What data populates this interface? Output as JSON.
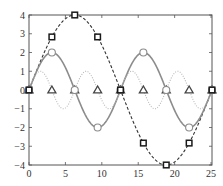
{
  "chart_data": {
    "type": "line",
    "title": "",
    "xlabel": "",
    "ylabel": "",
    "xlim": [
      0,
      25.1327
    ],
    "ylim": [
      -4,
      4
    ],
    "grid": false,
    "legend": null,
    "x_ticks": [
      0,
      5,
      10,
      15,
      20,
      25
    ],
    "y_ticks": [
      -4,
      -3,
      -2,
      -1,
      0,
      1,
      2,
      3,
      4
    ],
    "x_tick_labels": [
      "0",
      "5",
      "10",
      "15",
      "20",
      "25"
    ],
    "y_tick_labels": [
      "−4",
      "−3",
      "−2",
      "−1",
      "0",
      "1",
      "2",
      "3",
      "4"
    ],
    "series": [
      {
        "name": "4 sin(x/4)",
        "style": "dashed",
        "color": "#333333",
        "marker": "square",
        "amplitude": 4,
        "frequency": 0.25,
        "marker_x": [
          0,
          3.1416,
          6.2832,
          9.4248,
          12.5664,
          15.708,
          18.8496,
          21.9911,
          25.1327
        ],
        "marker_y": [
          0,
          2.83,
          4,
          2.83,
          0,
          -2.83,
          -4,
          -2.83,
          0
        ]
      },
      {
        "name": "2 sin(x/2)",
        "style": "solid",
        "color": "#8c8c8c",
        "marker": "circle",
        "amplitude": 2,
        "frequency": 0.5,
        "marker_x": [
          0,
          3.1416,
          6.2832,
          9.4248,
          12.5664,
          15.708,
          18.8496,
          21.9911,
          25.1327
        ],
        "marker_y": [
          0,
          2,
          0,
          -2,
          0,
          2,
          0,
          -2,
          0
        ]
      },
      {
        "name": "sin(x)",
        "style": "dotted",
        "color": "#b8b8b8",
        "marker": "triangle",
        "amplitude": 1,
        "frequency": 1,
        "marker_x": [
          0,
          3.1416,
          6.2832,
          9.4248,
          12.5664,
          15.708,
          18.8496,
          21.9911,
          25.1327
        ],
        "marker_y": [
          0,
          0,
          0,
          0,
          0,
          0,
          0,
          0,
          0
        ]
      }
    ]
  }
}
